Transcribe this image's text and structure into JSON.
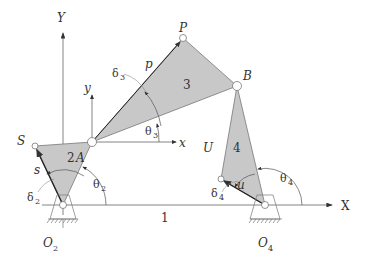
{
  "diagram": {
    "colors": {
      "link_fill": "#c8c8c8",
      "link_stroke": "#777777",
      "axis": "#555555",
      "text": "#333333"
    },
    "axes": {
      "global_x": "X",
      "global_y": "Y",
      "local_x": "x",
      "local_y": "y"
    },
    "points": {
      "O2": {
        "label": "O",
        "sub": "2"
      },
      "O4": {
        "label": "O",
        "sub": "4"
      },
      "A": {
        "label": "A"
      },
      "B": {
        "label": "B"
      },
      "P": {
        "label": "P"
      },
      "S": {
        "label": "S"
      },
      "U": {
        "label": "U"
      }
    },
    "links": {
      "ground": "1",
      "crank": "2",
      "coupler": "3",
      "rocker": "4"
    },
    "lengths": {
      "p": "p",
      "s": "s",
      "u": "u"
    },
    "angles": {
      "theta2": {
        "sym": "θ",
        "sub": "2"
      },
      "theta3": {
        "sym": "θ",
        "sub": "3"
      },
      "theta4": {
        "sym": "θ",
        "sub": "4"
      },
      "delta2": {
        "sym": "δ",
        "sub": "2"
      },
      "delta3": {
        "sym": "δ",
        "sub": "3"
      },
      "delta4": {
        "sym": "δ",
        "sub": "4"
      }
    }
  }
}
